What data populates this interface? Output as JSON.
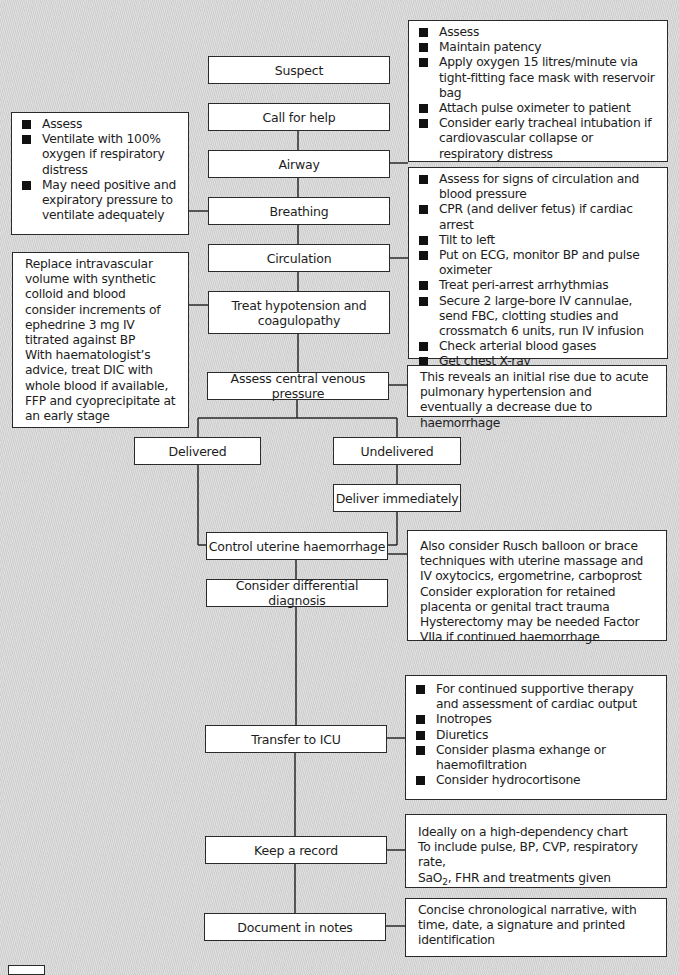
{
  "steps": {
    "suspect": "Suspect",
    "call_for_help": "Call for help",
    "airway": "Airway",
    "breathing": "Breathing",
    "circulation": "Circulation",
    "treat_hypotension": "Treat hypotension and coagulopathy",
    "assess_cvp": "Assess central venous pressure",
    "delivered": "Delivered",
    "undelivered": "Undelivered",
    "deliver_immediately": "Deliver immediately",
    "control_haemorrhage": "Control uterine haemorrhage",
    "differential_diagnosis": "Consider differential diagnosis",
    "transfer_icu": "Transfer to ICU",
    "keep_record": "Keep a record",
    "document_notes": "Document in notes"
  },
  "notes": {
    "airway": [
      "Assess",
      "Maintain patency",
      "Apply oxygen 15 litres/minute via tight-fitting face mask with reservoir bag",
      "Attach pulse oximeter to patient",
      "Consider early tracheal intubation if cardiovascular collapse or respiratory distress"
    ],
    "breathing": [
      "Assess",
      "Ventilate with 100% oxygen if respiratory distress",
      "May need positive and expiratory pressure to ventilate adequately"
    ],
    "circulation": [
      "Assess for signs of circulation and blood pressure",
      "CPR (and deliver fetus) if cardiac arrest",
      "Tilt to left",
      "Put on ECG, monitor BP and pulse oximeter",
      "Treat peri-arrest arrhythmias",
      "Secure 2 large-bore IV cannulae, send FBC, clotting studies and crossmatch 6 units, run IV infusion",
      "Check arterial blood gases",
      "Get chest X-ray"
    ],
    "hypotension": [
      "Replace intravascular volume with synthetic colloid and blood consider increments of ephedrine 3 mg IV titrated against BP",
      "With haematologist’s advice, treat DIC with whole blood if available, FFP and cyoprecipitate at an early stage"
    ],
    "cvp": "This reveals an initial rise due to acute pulmonary hypertension and eventually a decrease due to haemorrhage",
    "haemorrhage": [
      "Also consider Rusch balloon or brace techniques with uterine massage and IV oxytocics, ergometrine, carboprost",
      "Consider exploration for retained placenta or genital tract trauma",
      "Hysterectomy may be needed Factor VIIa if continued haemorrhage"
    ],
    "icu": [
      "For continued supportive therapy and assessment of cardiac output",
      "Inotropes",
      "Diuretics",
      "Consider plasma exhange or haemofiltration",
      "Consider hydrocortisone"
    ],
    "record": {
      "line1": "Ideally on a high-dependency chart",
      "line2": "To include pulse, BP, CVP, respiratory rate,",
      "line3_pre": "SaO",
      "line3_sub": "2",
      "line3_post": ", FHR and treatments given"
    },
    "document": "Concise chronological narrative, with time, date, a signature and printed identification"
  }
}
